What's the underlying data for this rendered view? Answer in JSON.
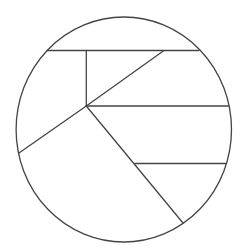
{
  "canvas": {
    "width": 246,
    "height": 252,
    "background": "#ffffff"
  },
  "style": {
    "stroke": "#444444",
    "stroke_width": 1.3
  },
  "circle": {
    "cx": 123.8,
    "cy": 129.5,
    "rx": 107.7,
    "ry": 112.5
  },
  "segments": [
    {
      "name": "top-chord",
      "x1": 47,
      "y1": 50.5,
      "x2": 199,
      "y2": 50.5
    },
    {
      "name": "vertical-divider",
      "x1": 86.3,
      "y1": 50.5,
      "x2": 86.3,
      "y2": 106
    },
    {
      "name": "upper-right-diagonal",
      "x1": 86.3,
      "y1": 106,
      "x2": 164,
      "y2": 50.5
    },
    {
      "name": "middle-chord",
      "x1": 86.3,
      "y1": 106,
      "x2": 229,
      "y2": 106
    },
    {
      "name": "lower-left-diagonal",
      "x1": 86.3,
      "y1": 106,
      "x2": 19,
      "y2": 153
    },
    {
      "name": "lower-right-diagonal",
      "x1": 86.3,
      "y1": 106,
      "x2": 183,
      "y2": 223
    },
    {
      "name": "lower-chord",
      "x1": 135,
      "y1": 163.5,
      "x2": 226.5,
      "y2": 163.5
    }
  ]
}
